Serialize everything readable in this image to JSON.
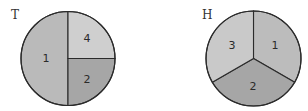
{
  "spinners": [
    {
      "id": "T",
      "label": "T",
      "center": [
        68,
        58.5
      ],
      "radius": 47,
      "sectors": [
        {
          "label": "1",
          "start_deg": 180,
          "end_deg": 360,
          "fill": "#bababa",
          "text_pos": [
            46,
            58
          ]
        },
        {
          "label": "4",
          "start_deg": 0,
          "end_deg": 90,
          "fill": "#cfcfcf",
          "text_pos": [
            87,
            38
          ]
        },
        {
          "label": "2",
          "start_deg": 90,
          "end_deg": 180,
          "fill": "#a6a6a6",
          "text_pos": [
            87,
            79
          ]
        }
      ]
    },
    {
      "id": "H",
      "label": "H",
      "center": [
        253.5,
        58.5
      ],
      "radius": 47.5,
      "sectors": [
        {
          "label": "1",
          "start_deg": 0,
          "end_deg": 120,
          "fill": "#bcbcbc",
          "text_pos": [
            275,
            45
          ]
        },
        {
          "label": "2",
          "start_deg": 120,
          "end_deg": 240,
          "fill": "#a6a6a6",
          "text_pos": [
            253,
            86
          ]
        },
        {
          "label": "3",
          "start_deg": 240,
          "end_deg": 360,
          "fill": "#c9c9c9",
          "text_pos": [
            232,
            45
          ]
        }
      ]
    }
  ]
}
